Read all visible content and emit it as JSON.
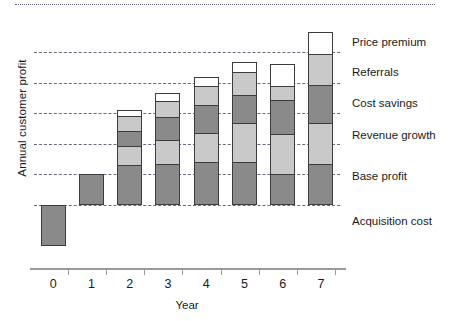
{
  "chart_data": {
    "type": "bar",
    "subtype": "stacked-bar",
    "title": "",
    "xlabel": "Year",
    "ylabel": "Annual customer profit",
    "categories": [
      "0",
      "1",
      "2",
      "3",
      "4",
      "5",
      "6",
      "7"
    ],
    "grid": true,
    "legend_position": "right-inline",
    "ylim": [
      -2,
      7
    ],
    "yticks_unlabeled": [
      0,
      1,
      2,
      3,
      4,
      5
    ],
    "series": [
      {
        "name": "Acquisition cost",
        "color": "#8a8a8a",
        "values": [
          -1.35,
          0,
          0,
          0,
          0,
          0,
          0,
          0
        ]
      },
      {
        "name": "Base profit",
        "color": "#8a8a8a",
        "values": [
          0,
          1.0,
          1.3,
          1.35,
          1.4,
          1.4,
          1.0,
          1.35
        ]
      },
      {
        "name": "Revenue growth",
        "color": "#c9c9c9",
        "values": [
          0,
          0,
          0.65,
          0.8,
          1.0,
          1.3,
          1.35,
          1.35
        ]
      },
      {
        "name": "Cost savings",
        "color": "#8a8a8a",
        "values": [
          0,
          0,
          0.55,
          0.8,
          0.95,
          0.95,
          1.15,
          1.3
        ]
      },
      {
        "name": "Referrals",
        "color": "#c9c9c9",
        "values": [
          0,
          0,
          0.5,
          0.55,
          0.65,
          0.8,
          0.5,
          1.05
        ]
      },
      {
        "name": "Price premium",
        "color": "#ffffff",
        "values": [
          0,
          0,
          0.25,
          0.3,
          0.3,
          0.35,
          0.75,
          0.75
        ]
      }
    ]
  },
  "axes": {
    "y_title": "Annual customer profit",
    "x_title": "Year",
    "x_tick_labels": [
      "0",
      "1",
      "2",
      "3",
      "4",
      "5",
      "6",
      "7"
    ]
  },
  "labels": {
    "price_premium": "Price premium",
    "referrals": "Referrals",
    "cost_savings": "Cost savings",
    "revenue_growth": "Revenue growth",
    "base_profit": "Base profit",
    "acquisition_cost": "Acquisition cost"
  },
  "colors": {
    "dark_segment": "#8a8a8a",
    "light_segment": "#c9c9c9",
    "white_segment": "#ffffff",
    "segment_outline": "#3c3c3c",
    "gridline": "#5a5a72",
    "axis": "#9a9a9a",
    "text": "#1a1a1a"
  }
}
